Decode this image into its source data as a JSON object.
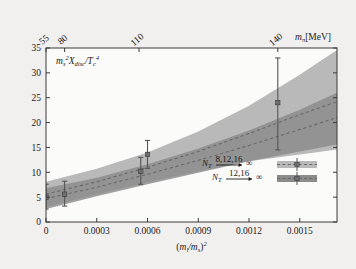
{
  "chart_data": {
    "type": "area",
    "title": "",
    "ylabel": "m_s^2 X_disc / T_c^4",
    "xlabel": "(m_l/m_s)^2",
    "xlim": [
      0,
      0.00172
    ],
    "ylim": [
      0,
      35
    ],
    "grid": false,
    "legend_position": "inside-bottom-right",
    "x_ticks": [
      0,
      0.0003,
      0.0006,
      0.0009,
      0.0012,
      0.0015
    ],
    "x_tick_labels": [
      "0",
      "0.0003",
      "0.0006",
      "0.0009",
      "0.0012",
      "0.0015"
    ],
    "y_ticks": [
      0,
      5,
      10,
      15,
      20,
      25,
      30,
      35
    ],
    "y_tick_labels": [
      "0",
      "5",
      "10",
      "15",
      "20",
      "25",
      "30",
      "35"
    ],
    "top_axis": {
      "label": "m_pi [MeV]",
      "ticks": [
        55,
        80,
        110,
        140
      ],
      "tick_labels": [
        "55",
        "80",
        "110",
        "140"
      ],
      "tick_x_positions": [
        0.0,
        0.00011,
        0.00055,
        0.00137
      ]
    },
    "series": [
      {
        "name": "N_T 8,12,16 -> infinity",
        "style": "band-light",
        "color": "#b9b9b9",
        "x": [
          0,
          0.0003,
          0.0006,
          0.0009,
          0.0012,
          0.0015,
          0.00172
        ],
        "center": [
          5.6,
          8.1,
          11.0,
          14.2,
          17.8,
          21.6,
          24.2
        ],
        "lower": [
          3.0,
          5.6,
          8.0,
          10.2,
          12.2,
          13.6,
          14.6
        ],
        "upper": [
          8.1,
          10.7,
          14.0,
          18.2,
          23.4,
          29.6,
          34.6
        ],
        "dashed_center": true
      },
      {
        "name": "N_T 12,16 -> infinity",
        "style": "band-dark",
        "color": "#8b8b8b",
        "x": [
          0,
          0.0003,
          0.0006,
          0.0009,
          0.0012,
          0.0015,
          0.00172
        ],
        "center": [
          4.7,
          7.0,
          9.6,
          12.4,
          15.4,
          18.6,
          21.0
        ],
        "lower": [
          2.6,
          5.2,
          7.6,
          9.9,
          12.2,
          14.2,
          15.6
        ],
        "upper": [
          6.8,
          8.9,
          11.6,
          14.8,
          18.4,
          22.6,
          26.0
        ],
        "dashed_center": true
      }
    ],
    "error_bars": [
      {
        "x": 0.0,
        "y": 5.0,
        "yerr_low": 2.4,
        "yerr_high": 2.6,
        "series": "N_T 8,12,16 -> infinity"
      },
      {
        "x": 0.00011,
        "y": 5.6,
        "yerr_low": 2.4,
        "yerr_high": 2.6,
        "series": "N_T 8,12,16 -> infinity"
      },
      {
        "x": 0.00056,
        "y": 10.2,
        "yerr_low": 2.6,
        "yerr_high": 2.8,
        "series": "N_T 12,16 -> infinity"
      },
      {
        "x": 0.0006,
        "y": 13.6,
        "yerr_low": 2.8,
        "yerr_high": 2.8,
        "series": "N_T 8,12,16 -> infinity"
      },
      {
        "x": 0.00137,
        "y": 24.0,
        "yerr_low": 9.5,
        "yerr_high": 9.0,
        "series": "N_T 8,12,16 -> infinity"
      }
    ],
    "annotations": []
  },
  "axis": {
    "y_title_main": "m",
    "y_title_sub1": "s",
    "y_title_sup1": "2",
    "y_title_x": "X",
    "y_title_sub2": "disc",
    "y_title_slash": "/T",
    "y_title_sub3": "c",
    "y_title_sup2": "4",
    "x_title_open": "(",
    "x_title_m1": "m",
    "x_title_sub1": "l",
    "x_title_slash": "/m",
    "x_title_sub2": "s",
    "x_title_close": ")",
    "x_title_sup": "2",
    "top_title_m": "m",
    "top_title_sub": "π",
    "top_title_unit": "[MeV]"
  },
  "legend": {
    "entries": [
      {
        "symbol": "N",
        "sub": "T",
        "over": "8,12,16",
        "arrow": "→",
        "limit": "∞",
        "swatch_color": "#b9b9b9"
      },
      {
        "symbol": "N",
        "sub": "T",
        "over": "12,16",
        "arrow": "→",
        "limit": "∞",
        "swatch_color": "#8b8b8b"
      }
    ]
  },
  "colors": {
    "background": "#f2f0ee",
    "plot_background": "#fbfbfa",
    "axis": "#3a3a3a",
    "band_light": "#b9b9b9",
    "band_dark": "#8b8b8b",
    "band_overlap": "#9c9c9c",
    "dash_line": "#6a6a6a",
    "error_bar": "#555555"
  }
}
